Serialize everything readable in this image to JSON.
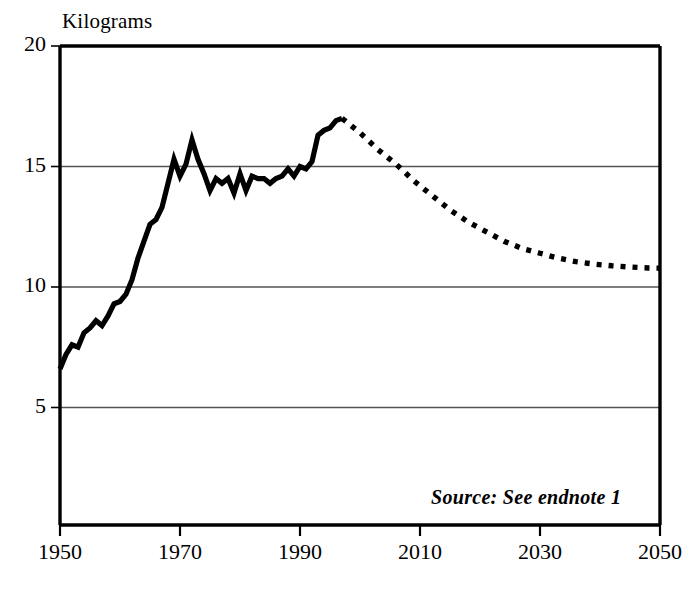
{
  "chart_data": {
    "type": "line",
    "title": "",
    "subtitle": "",
    "xlabel": "",
    "ylabel": "Kilograms",
    "xlim": [
      1950,
      2050
    ],
    "ylim": [
      0,
      20
    ],
    "grid": true,
    "grid_axis": "y",
    "legend": false,
    "legend_position": "none",
    "annotations": [
      {
        "name": "source",
        "text": "Source: See endnote 1",
        "x": 2035,
        "y": 2.4
      }
    ],
    "yticks": [
      5,
      10,
      15,
      20
    ],
    "ytick_labels": [
      "5",
      "10",
      "15",
      "20"
    ],
    "xticks": [
      1950,
      1970,
      1990,
      2010,
      2030,
      2050
    ],
    "xtick_labels": [
      "1950",
      "1970",
      "1990",
      "2010",
      "2030",
      "2050"
    ],
    "series": [
      {
        "name": "Historical",
        "style": "solid",
        "color": "#000000",
        "x": [
          1950,
          1951,
          1952,
          1953,
          1954,
          1955,
          1956,
          1957,
          1958,
          1959,
          1960,
          1961,
          1962,
          1963,
          1964,
          1965,
          1966,
          1967,
          1968,
          1969,
          1970,
          1971,
          1972,
          1973,
          1974,
          1975,
          1976,
          1977,
          1978,
          1979,
          1980,
          1981,
          1982,
          1983,
          1984,
          1985,
          1986,
          1987,
          1988,
          1989,
          1990,
          1991,
          1992,
          1993,
          1994,
          1995,
          1996,
          1997
        ],
        "y": [
          6.6,
          7.2,
          7.6,
          7.5,
          8.1,
          8.3,
          8.6,
          8.4,
          8.8,
          9.3,
          9.4,
          9.7,
          10.3,
          11.2,
          11.9,
          12.6,
          12.8,
          13.3,
          14.3,
          15.3,
          14.6,
          15.1,
          16.1,
          15.3,
          14.7,
          14.0,
          14.5,
          14.3,
          14.5,
          13.9,
          14.7,
          14.0,
          14.6,
          14.5,
          14.5,
          14.3,
          14.5,
          14.6,
          14.9,
          14.6,
          15.0,
          14.9,
          15.2,
          16.3,
          16.5,
          16.6,
          16.9,
          17.0
        ]
      },
      {
        "name": "Projection",
        "style": "dotted",
        "color": "#000000",
        "x": [
          1997,
          2000,
          2003,
          2006,
          2009,
          2012,
          2015,
          2018,
          2021,
          2024,
          2027,
          2030,
          2033,
          2036,
          2039,
          2042,
          2045,
          2048,
          2050
        ],
        "y": [
          17.0,
          16.4,
          15.7,
          15.1,
          14.4,
          13.8,
          13.2,
          12.7,
          12.3,
          11.9,
          11.6,
          11.4,
          11.2,
          11.05,
          10.95,
          10.88,
          10.83,
          10.79,
          10.78
        ]
      }
    ]
  },
  "labels": {
    "y_axis_title": "Kilograms",
    "source_note": "Source: See endnote 1"
  },
  "colors": {
    "axis": "#000000",
    "grid": "#555555",
    "line": "#000000",
    "background": "#ffffff"
  }
}
